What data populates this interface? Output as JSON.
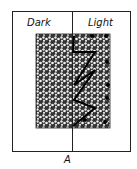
{
  "figure": {
    "left_label": "Dark",
    "right_label": "Light",
    "caption": "A"
  },
  "path_points": [
    [
      74,
      36
    ],
    [
      73,
      52
    ],
    [
      95,
      52
    ],
    [
      74,
      85
    ],
    [
      95,
      70
    ],
    [
      74,
      100
    ],
    [
      95,
      108
    ],
    [
      73,
      126
    ]
  ],
  "dots": [
    [
      92,
      36
    ],
    [
      106,
      36
    ],
    [
      107,
      62
    ],
    [
      108,
      85
    ],
    [
      107,
      98
    ],
    [
      85,
      120
    ],
    [
      105,
      122
    ]
  ]
}
